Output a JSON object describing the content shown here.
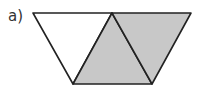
{
  "label": "a)",
  "figure": {
    "colors": {
      "stroke": "#222222",
      "shaded": "#c8c8c8",
      "unshaded": "#ffffff"
    },
    "triangles": [
      {
        "name": "left",
        "shaded": false
      },
      {
        "name": "middle",
        "shaded": true
      },
      {
        "name": "right",
        "shaded": true
      }
    ],
    "shaded_count": 2,
    "total_count": 3
  }
}
